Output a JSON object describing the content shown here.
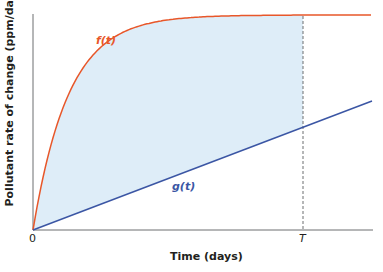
{
  "chart_data": {
    "type": "line",
    "title": "",
    "xlabel": "Time (days)",
    "ylabel": "Pollutant rate of change (ppm/day)",
    "x_ticks": [
      "0",
      "T"
    ],
    "y_ticks": [],
    "grid": false,
    "legend": "none (inline curve labels)",
    "series": [
      {
        "name": "f(t)",
        "color": "#e8572a",
        "shape": "saturating curve rising quickly from 0 and leveling off near the top"
      },
      {
        "name": "g(t)",
        "color": "#3b56a4",
        "shape": "straight line rising linearly from origin"
      }
    ],
    "annotations": [
      {
        "type": "vertical-dashed-line",
        "x": "T"
      },
      {
        "type": "shaded-region",
        "between": [
          "f(t)",
          "g(t)"
        ],
        "from": "0",
        "to": "T",
        "color": "#deedf8"
      }
    ]
  },
  "labels": {
    "xlabel": "Time (days)",
    "ylabel": "Pollutant rate of change (ppm/day)",
    "x0": "0",
    "xT": "T",
    "f": "f(t)",
    "g": "g(t)"
  },
  "colors": {
    "f": "#e8572a",
    "g": "#3b56a4",
    "fill": "#deedf8",
    "axis": "#6d6e71"
  }
}
